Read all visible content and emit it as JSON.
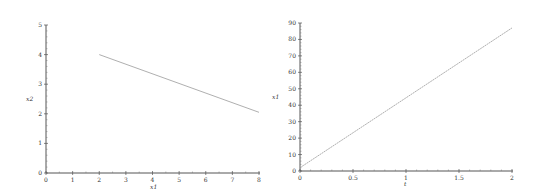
{
  "chart_data": [
    {
      "type": "line",
      "title": "",
      "xlabel": "x1",
      "ylabel": "x2",
      "xlim": [
        0,
        8
      ],
      "ylim": [
        0,
        5
      ],
      "xticks": [
        "0",
        "1",
        "2",
        "3",
        "4",
        "5",
        "6",
        "7",
        "8"
      ],
      "yticks": [
        "0",
        "1",
        "2",
        "3",
        "4",
        "5"
      ],
      "grid": false,
      "legend": null,
      "series": [
        {
          "name": "x2 vs x1",
          "x": [
            2,
            8
          ],
          "y": [
            4.0,
            2.05
          ],
          "color": "#9a9a9a"
        }
      ]
    },
    {
      "type": "line",
      "title": "",
      "xlabel": "t",
      "ylabel": "x1",
      "xlim": [
        0,
        2
      ],
      "ylim": [
        0,
        90
      ],
      "xticks": [
        "0",
        "0.5",
        "1",
        "1.5",
        "2"
      ],
      "yticks": [
        "0",
        "10",
        "20",
        "30",
        "40",
        "50",
        "60",
        "70",
        "80",
        "90"
      ],
      "grid": false,
      "legend": null,
      "series": [
        {
          "name": "x1 vs t",
          "x": [
            0,
            2
          ],
          "y": [
            2,
            87
          ],
          "color": "#9a9a9a"
        }
      ]
    }
  ],
  "plots": {
    "left": {
      "xlabel": "x1",
      "ylabel": "x2",
      "xticks": [
        "0",
        "1",
        "2",
        "3",
        "4",
        "5",
        "6",
        "7",
        "8"
      ],
      "yticks": [
        "0",
        "1",
        "2",
        "3",
        "4",
        "5"
      ]
    },
    "right": {
      "xlabel": "t",
      "ylabel": "x1",
      "xticks": [
        "0",
        "0.5",
        "1",
        "1.5",
        "2"
      ],
      "yticks": [
        "0",
        "10",
        "20",
        "30",
        "40",
        "50",
        "60",
        "70",
        "80",
        "90"
      ]
    }
  }
}
